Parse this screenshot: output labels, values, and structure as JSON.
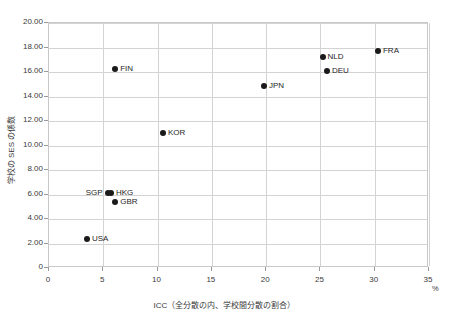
{
  "chart_data": {
    "type": "scatter",
    "title": "",
    "xlabel": "ICC（全分散の内、学校間分散の割合）",
    "ylabel": "学校の SES の係数",
    "x_unit": "%",
    "xlim": [
      0,
      35
    ],
    "ylim": [
      0,
      20
    ],
    "xticks": [
      0,
      5,
      10,
      15,
      20,
      25,
      30,
      35
    ],
    "xtick_labels": [
      "0",
      "5",
      "10",
      "15",
      "20",
      "25",
      "30",
      "35"
    ],
    "yticks": [
      0,
      2,
      4,
      6,
      8,
      10,
      12,
      14,
      16,
      18,
      20
    ],
    "ytick_labels": [
      "0",
      "2.00",
      "4.00",
      "6.00",
      "8.00",
      "10.00",
      "12.00",
      "14.00",
      "16.00",
      "18.00",
      "20.00"
    ],
    "grid": true,
    "legend": "none",
    "marker_color": "#1a1a1a",
    "grid_color": "#d3d3d3",
    "points": [
      {
        "label": "USA",
        "x": 3.5,
        "y": 2.35,
        "label_pos": "right"
      },
      {
        "label": "SGP",
        "x": 5.4,
        "y": 6.1,
        "label_pos": "left"
      },
      {
        "label": "HKG",
        "x": 5.7,
        "y": 6.1,
        "label_pos": "right"
      },
      {
        "label": "GBR",
        "x": 6.1,
        "y": 5.35,
        "label_pos": "right"
      },
      {
        "label": "FIN",
        "x": 6.1,
        "y": 16.25,
        "label_pos": "right"
      },
      {
        "label": "KOR",
        "x": 10.5,
        "y": 11.0,
        "label_pos": "right"
      },
      {
        "label": "JPN",
        "x": 19.8,
        "y": 14.85,
        "label_pos": "right"
      },
      {
        "label": "NLD",
        "x": 25.2,
        "y": 17.25,
        "label_pos": "right"
      },
      {
        "label": "DEU",
        "x": 25.6,
        "y": 16.1,
        "label_pos": "right"
      },
      {
        "label": "FRA",
        "x": 30.3,
        "y": 17.7,
        "label_pos": "right"
      }
    ]
  }
}
